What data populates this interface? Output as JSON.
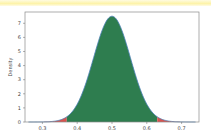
{
  "chart_data": {
    "type": "area",
    "title": "",
    "xlabel": "",
    "ylabel": "Density",
    "xlim": [
      0.25,
      0.75
    ],
    "ylim": [
      0,
      7.8
    ],
    "xticks": [
      0.3,
      0.4,
      0.5,
      0.6,
      0.7
    ],
    "xtick_labels": [
      "0.3",
      "0.4",
      "0.5",
      "0.6",
      "0.7"
    ],
    "yticks": [
      0,
      1,
      2,
      3,
      4,
      5,
      6,
      7
    ],
    "ytick_labels": [
      "0",
      "1",
      "2",
      "3",
      "4",
      "5",
      "6",
      "7"
    ],
    "grid": false,
    "legend": null,
    "series": [
      {
        "name": "density",
        "distribution": "approximately normal",
        "mean": 0.5,
        "std": 0.053,
        "peak": 7.5,
        "x": [
          0.25,
          0.3,
          0.33,
          0.35,
          0.37,
          0.4,
          0.42,
          0.44,
          0.46,
          0.48,
          0.5,
          0.52,
          0.54,
          0.56,
          0.58,
          0.6,
          0.63,
          0.65,
          0.67,
          0.7,
          0.75
        ],
        "y": [
          0.0,
          0.06,
          0.27,
          0.55,
          1.1,
          1.6,
          3.0,
          4.0,
          5.9,
          7.0,
          7.5,
          7.0,
          5.9,
          4.0,
          3.0,
          1.6,
          0.45,
          0.27,
          0.1,
          0.03,
          0.0
        ]
      }
    ],
    "regions": [
      {
        "name": "lower-tail",
        "range": [
          0.25,
          0.37
        ],
        "color": "#d9534f"
      },
      {
        "name": "central-interval",
        "range": [
          0.37,
          0.63
        ],
        "color": "#2e7d4f"
      },
      {
        "name": "upper-tail",
        "range": [
          0.63,
          0.75
        ],
        "color": "#d9534f"
      }
    ],
    "colors": {
      "center_fill": "#2e7d4f",
      "tail_fill": "#d9534f",
      "outline": "#4a7fb5",
      "frame": "#888888"
    }
  },
  "page": {
    "highlight_color": "#fdf3a8"
  }
}
